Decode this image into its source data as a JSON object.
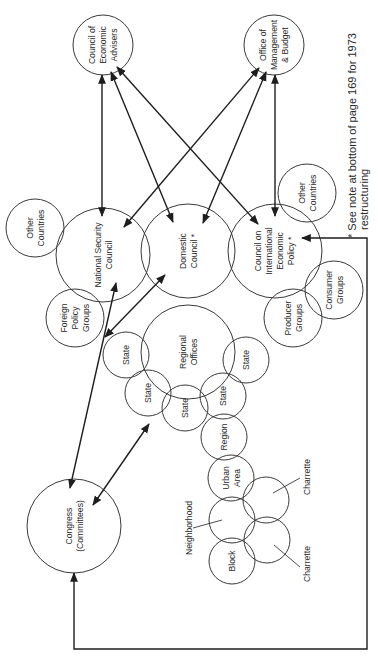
{
  "diagram": {
    "orientation": "rotated -90deg (text reads bottom-to-top)",
    "nodes": [
      {
        "id": "cea",
        "lines": [
          "Council of",
          "Economic",
          "Advisers"
        ]
      },
      {
        "id": "omb",
        "lines": [
          "Office of",
          "Management",
          "& Budget"
        ]
      },
      {
        "id": "nsc",
        "lines": [
          "National Security",
          "Council"
        ]
      },
      {
        "id": "dc",
        "lines": [
          "Domestic",
          "Council *"
        ]
      },
      {
        "id": "ciep",
        "lines": [
          "Council on",
          "International",
          "Economic",
          "Policy *"
        ]
      },
      {
        "id": "other_countries_left",
        "lines": [
          "Other",
          "Countries"
        ]
      },
      {
        "id": "other_countries_right",
        "lines": [
          "Other",
          "Countries"
        ]
      },
      {
        "id": "foreign_policy_groups",
        "lines": [
          "Foreign",
          "Policy",
          "Groups"
        ]
      },
      {
        "id": "regional_offices",
        "lines": [
          "Regional",
          "Offices"
        ]
      },
      {
        "id": "consumer_groups",
        "lines": [
          "Consumer",
          "Groups"
        ]
      },
      {
        "id": "producer_groups",
        "lines": [
          "Producer",
          "Groups"
        ]
      },
      {
        "id": "state_1",
        "lines": [
          "State"
        ]
      },
      {
        "id": "state_2",
        "lines": [
          "State"
        ]
      },
      {
        "id": "state_3",
        "lines": [
          "State"
        ]
      },
      {
        "id": "state_4",
        "lines": [
          "State"
        ]
      },
      {
        "id": "state_5",
        "lines": [
          "State"
        ]
      },
      {
        "id": "region",
        "lines": [
          "Region"
        ]
      },
      {
        "id": "urban_area",
        "lines": [
          "Urban",
          "Area"
        ]
      },
      {
        "id": "neighborhood",
        "lines": [
          "Neighborhood"
        ]
      },
      {
        "id": "block",
        "lines": [
          "Block"
        ]
      },
      {
        "id": "charrette_1",
        "lines": [
          "Charrette"
        ]
      },
      {
        "id": "charrette_2",
        "lines": [
          "Charrette"
        ]
      },
      {
        "id": "congress",
        "lines": [
          "Congress",
          "(Committees)"
        ]
      }
    ],
    "edges": [
      {
        "from": "cea",
        "to": "nsc",
        "type": "double-arrow"
      },
      {
        "from": "cea",
        "to": "dc",
        "type": "double-arrow"
      },
      {
        "from": "cea",
        "to": "ciep",
        "type": "double-arrow"
      },
      {
        "from": "omb",
        "to": "nsc",
        "type": "double-arrow"
      },
      {
        "from": "omb",
        "to": "dc",
        "type": "double-arrow"
      },
      {
        "from": "omb",
        "to": "ciep",
        "type": "double-arrow"
      },
      {
        "from": "congress",
        "to": "nsc",
        "type": "double-arrow"
      },
      {
        "from": "congress",
        "to": "dc",
        "type": "double-arrow"
      },
      {
        "from": "congress",
        "to": "regional_offices",
        "type": "double-arrow"
      },
      {
        "from": "congress",
        "to": "ciep",
        "type": "elbow-double-arrow"
      }
    ],
    "footnote": {
      "line1": "* See note at bottom of page 169 for 1973",
      "line2": "restructuring"
    }
  }
}
